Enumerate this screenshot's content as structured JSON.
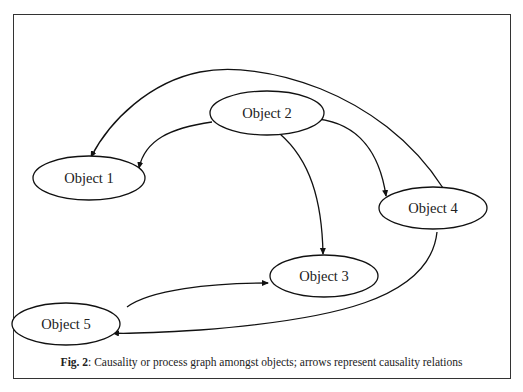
{
  "figure": {
    "caption_label": "Fig. 2",
    "caption_text": ": Causality or process graph amongst objects; arrows represent causality relations"
  },
  "nodes": [
    {
      "id": "object1",
      "label": "Object 1",
      "cx": 89,
      "cy": 178,
      "rx": 56,
      "ry": 22
    },
    {
      "id": "object2",
      "label": "Object 2",
      "cx": 267,
      "cy": 113,
      "rx": 57,
      "ry": 22
    },
    {
      "id": "object3",
      "label": "Object 3",
      "cx": 324,
      "cy": 276,
      "rx": 54,
      "ry": 21
    },
    {
      "id": "object4",
      "label": "Object 4",
      "cx": 433,
      "cy": 208,
      "rx": 54,
      "ry": 21
    },
    {
      "id": "object5",
      "label": "Object 5",
      "cx": 66,
      "cy": 324,
      "rx": 54,
      "ry": 21
    }
  ],
  "edges": [
    {
      "from": "Object 2",
      "to": "Object 1"
    },
    {
      "from": "Object 2",
      "to": "Object 3"
    },
    {
      "from": "Object 2",
      "to": "Object 4"
    },
    {
      "from": "Object 4",
      "to": "Object 1"
    },
    {
      "from": "Object 4",
      "to": "Object 5"
    },
    {
      "from": "Object 5",
      "to": "Object 3"
    }
  ]
}
